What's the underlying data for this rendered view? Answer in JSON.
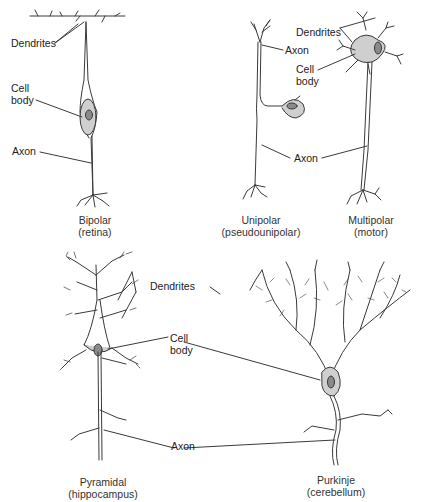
{
  "neurons": [
    {
      "id": "bipolar",
      "caption_line1": "Bipolar",
      "caption_line2": "(retina)",
      "labels": {
        "dendrites": "Dendrites",
        "cell_body_1": "Cell",
        "cell_body_2": "body",
        "axon": "Axon"
      }
    },
    {
      "id": "unipolar",
      "caption_line1": "Unipolar",
      "caption_line2": "(pseudounipolar)",
      "labels": {
        "axon_top": "Axon",
        "cell_body_1": "Cell",
        "cell_body_2": "body"
      }
    },
    {
      "id": "multipolar",
      "caption_line1": "Multipolar",
      "caption_line2": "(motor)",
      "labels": {
        "dendrites": "Dendrites"
      }
    },
    {
      "id": "pyramidal",
      "caption_line1": "Pyramidal",
      "caption_line2": "(hippocampus)",
      "labels": {}
    },
    {
      "id": "purkinje",
      "caption_line1": "Purkinje",
      "caption_line2": "(cerebellum)",
      "labels": {}
    }
  ],
  "shared_labels": {
    "upper_axon": "Axon",
    "lower_dendrites": "Dendrites",
    "lower_cell_body_1": "Cell",
    "lower_cell_body_2": "body",
    "lower_axon": "Axon"
  },
  "colors": {
    "line": "#3a3a3a",
    "cell_body": "#cfcfcf",
    "nucleus": "#8a8a8a"
  }
}
